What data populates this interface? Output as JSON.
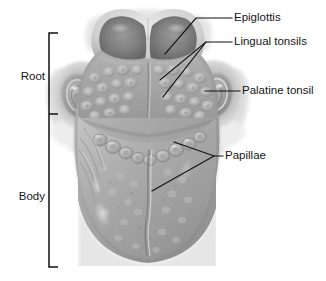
{
  "figure": {
    "background_color": "#ffffff",
    "line_color": "#111111",
    "text_color": "#161616",
    "width": 326,
    "height": 281
  },
  "bracket_labels": [
    {
      "id": "root",
      "label": "Root",
      "text_x": 45,
      "text_y": 77
    },
    {
      "id": "body",
      "label": "Body",
      "text_x": 45,
      "text_y": 197
    }
  ],
  "bracket": {
    "x": 49,
    "top_y": 33,
    "mid_y": 114,
    "bottom_y": 267,
    "tick_length": 9
  },
  "callouts": [
    {
      "id": "epiglottis",
      "label": "Epiglottis",
      "text_x": 234,
      "text_y": 18,
      "leader": "M 232 18 L 196 18 L 165 54"
    },
    {
      "id": "lingual-tonsils",
      "label": "Lingual tonsils",
      "text_x": 234,
      "text_y": 42,
      "leader": "M 232 42 L 206 42 L 160 80 M 206 42 L 163 97"
    },
    {
      "id": "palatine-tonsil",
      "label": "Palatine tonsil",
      "text_x": 242,
      "text_y": 91,
      "leader": "M 240 91 L 205 91"
    },
    {
      "id": "papillae",
      "label": "Papillae",
      "text_x": 225,
      "text_y": 156,
      "leader": "M 223 156 L 214 156 L 174 142 M 214 156 L 152 191"
    }
  ],
  "anatomy_regions": [
    {
      "id": "epiglottis-body",
      "name": "Epiglottis"
    },
    {
      "id": "lingual-tonsil-field",
      "name": "Lingual tonsils"
    },
    {
      "id": "palatine-tonsil-left",
      "name": "Palatine tonsil (left)"
    },
    {
      "id": "palatine-tonsil-right",
      "name": "Palatine tonsil (right)"
    },
    {
      "id": "circumvallate-papillae-row",
      "name": "Circumvallate papillae"
    },
    {
      "id": "tongue-body-surface",
      "name": "Body of tongue"
    },
    {
      "id": "median-sulcus",
      "name": "Median sulcus"
    }
  ]
}
